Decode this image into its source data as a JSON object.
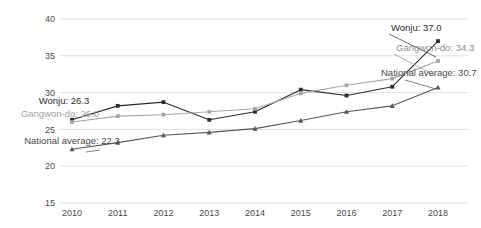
{
  "chart_data": {
    "type": "line",
    "title": "",
    "subtitle": "",
    "xlabel": "",
    "ylabel": "",
    "categories": [
      "2010",
      "2011",
      "2012",
      "2013",
      "2014",
      "2015",
      "2016",
      "2017",
      "2018"
    ],
    "x": [
      2010,
      2011,
      2012,
      2013,
      2014,
      2015,
      2016,
      2017,
      2018
    ],
    "ylim": [
      15,
      40
    ],
    "yticks": [
      15,
      20,
      25,
      30,
      35,
      40
    ],
    "ytick_labels": [
      "15",
      "20",
      "25",
      "30",
      "35",
      "40"
    ],
    "grid": true,
    "grid_axis": "y",
    "legend": "none",
    "legend_position": "inline-endpoint-labels",
    "series": [
      {
        "name": "Wonju",
        "color": "#2b2b2b",
        "marker": "square",
        "values": [
          26.3,
          28.2,
          28.7,
          26.3,
          27.4,
          30.4,
          29.6,
          30.8,
          37.0
        ]
      },
      {
        "name": "Gangwon-do",
        "color": "#a8a8a8",
        "marker": "square",
        "values": [
          26.0,
          26.8,
          27.0,
          27.4,
          27.8,
          29.9,
          31.0,
          31.9,
          34.3
        ]
      },
      {
        "name": "National average",
        "color": "#595959",
        "marker": "triangle",
        "values": [
          22.3,
          23.2,
          24.2,
          24.6,
          25.1,
          26.2,
          27.4,
          28.2,
          30.7
        ]
      }
    ],
    "annotations": [
      {
        "id": "left-wonju",
        "text": "Wonju: 26.3",
        "series": "Wonju",
        "at_category": "2010",
        "value": 26.3,
        "side": "left",
        "color": "#2b2b2b"
      },
      {
        "id": "left-gangwon",
        "text": "Gangwon-do: 26.0",
        "series": "Gangwon-do",
        "at_category": "2010",
        "value": 26.0,
        "side": "left",
        "color": "#a0a0a0"
      },
      {
        "id": "left-national",
        "text": "National average: 22.3",
        "series": "National average",
        "at_category": "2010",
        "value": 22.3,
        "side": "left",
        "color": "#4a4a4a"
      },
      {
        "id": "right-wonju",
        "text": "Wonju: 37.0",
        "series": "Wonju",
        "at_category": "2018",
        "value": 37.0,
        "side": "right",
        "color": "#2b2b2b"
      },
      {
        "id": "right-gangwon",
        "text": "Gangwon-do: 34.3",
        "series": "Gangwon-do",
        "at_category": "2018",
        "value": 34.3,
        "side": "right",
        "color": "#8d8d8d"
      },
      {
        "id": "right-national",
        "text": "National average: 30.7",
        "series": "National average",
        "at_category": "2018",
        "value": 30.7,
        "side": "right",
        "color": "#4a4a4a"
      }
    ]
  },
  "labels": {
    "yticks": [
      "40",
      "35",
      "30",
      "25",
      "20",
      "15"
    ],
    "xticks": [
      "2010",
      "2011",
      "2012",
      "2013",
      "2014",
      "2015",
      "2016",
      "2017",
      "2018"
    ],
    "ann_left_wonju": "Wonju: 26.3",
    "ann_left_gangwon": "Gangwon-do: 26.0",
    "ann_left_national": "National average: 22.3",
    "ann_right_wonju": "Wonju: 37.0",
    "ann_right_gangwon": "Gangwon-do: 34.3",
    "ann_right_national": "National average: 30.7"
  },
  "colors": {
    "wonju": "#2b2b2b",
    "gangwon": "#a8a8a8",
    "national": "#595959",
    "grid": "#d9d9d9",
    "text": "#4a4a4a",
    "background": "#ffffff"
  }
}
